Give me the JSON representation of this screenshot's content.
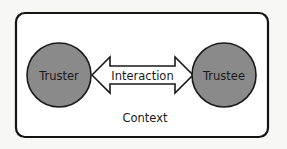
{
  "diagram": {
    "type": "trust-relationship",
    "container": {
      "label": "Context",
      "border_color": "#141414",
      "fill": "#ffffff"
    },
    "nodes": [
      {
        "id": "truster",
        "label": "Truster",
        "fill": "#8a8a8a",
        "stroke": "#1a1a1a"
      },
      {
        "id": "trustee",
        "label": "Trustee",
        "fill": "#8a8a8a",
        "stroke": "#1a1a1a"
      }
    ],
    "edge": {
      "label": "Interaction",
      "style": "double-headed-block-arrow",
      "from": "truster",
      "to": "trustee",
      "fill": "#ffffff",
      "stroke": "#1a1a1a"
    }
  }
}
